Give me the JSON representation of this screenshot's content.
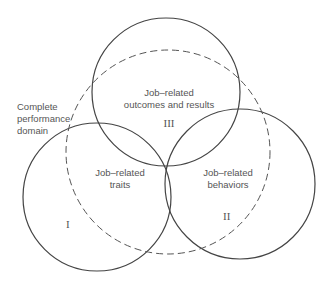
{
  "diagram": {
    "domain_label": {
      "line1": "Complete",
      "line2": "performance",
      "line3": "domain"
    },
    "circles": [
      {
        "id": "III",
        "line1": "Job–related",
        "line2": "outcomes and results",
        "numeral": "III"
      },
      {
        "id": "I",
        "line1": "Job–related",
        "line2": "traits",
        "numeral": "I"
      },
      {
        "id": "II",
        "line1": "Job–related",
        "line2": "behaviors",
        "numeral": "II"
      }
    ],
    "colors": {
      "stroke": "#444444",
      "text": "#555555"
    }
  }
}
